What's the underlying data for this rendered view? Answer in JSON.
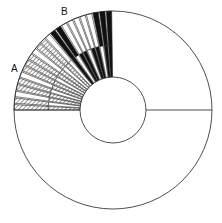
{
  "labels": {
    "a": {
      "text": "A",
      "x": 11,
      "y": 64
    },
    "b": {
      "text": "B",
      "x": 61,
      "y": 7
    }
  },
  "geometry": {
    "cx": 113,
    "cy": 110,
    "outer_r": 99,
    "inner_r": 33,
    "mid_r": 65,
    "start_deg": 180,
    "end_deg": 90
  },
  "colors": {
    "stroke": "#222222",
    "black": "#111111",
    "hatch": "#9a9a9a",
    "white": "#ffffff"
  },
  "wedges": [
    {
      "inner": "hatch",
      "outer": "hatch"
    },
    {
      "inner": "white",
      "outer": "hatch"
    },
    {
      "inner": "hatch",
      "outer": "white"
    },
    {
      "inner": "hatch",
      "outer": "hatch"
    },
    {
      "inner": "white",
      "outer": "hatch"
    },
    {
      "inner": "hatch",
      "outer": "white"
    },
    {
      "inner": "hatch",
      "outer": "hatch"
    },
    {
      "inner": "white",
      "outer": "hatch"
    },
    {
      "inner": "hatch",
      "outer": "hatch"
    },
    {
      "inner": "hatch",
      "outer": "white"
    },
    {
      "inner": "white",
      "outer": "hatch"
    },
    {
      "inner": "hatch",
      "outer": "hatch"
    },
    {
      "inner": "white",
      "outer": "white"
    },
    {
      "inner": "black",
      "outer": "black"
    },
    {
      "inner": "white",
      "outer": "black"
    },
    {
      "inner": "black",
      "outer": "white"
    },
    {
      "inner": "black",
      "outer": "white"
    },
    {
      "inner": "white",
      "outer": "white"
    },
    {
      "inner": "black",
      "outer": "white"
    },
    {
      "inner": "black",
      "outer": "white"
    },
    {
      "inner": "white",
      "outer": "black"
    },
    {
      "inner": "black",
      "outer": "black"
    },
    {
      "inner": "black",
      "outer": "black"
    }
  ]
}
